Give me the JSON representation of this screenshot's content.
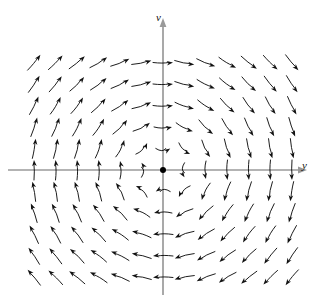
{
  "figure": {
    "kind": "direction-field",
    "background_color": "#ffffff"
  },
  "axes": {
    "horizontal": {
      "label": "y",
      "label_style": "italic",
      "color": "#9a9a9a",
      "has_arrowhead": true,
      "arrowhead_side": "right"
    },
    "vertical": {
      "label": "v",
      "label_style": "italic",
      "color": "#9a9a9a",
      "has_arrowhead": true,
      "arrowhead_side": "top"
    },
    "origin_marker": {
      "shape": "filled-dot",
      "color": "#000000",
      "radius_px": 3
    }
  },
  "chart_data": {
    "type": "scatter",
    "title": "",
    "subtitle": "",
    "xlabel": "y",
    "ylabel": "v",
    "grid": false,
    "legend": null,
    "annotations": [],
    "field": {
      "name": "clockwise-center",
      "formula_u": "v",
      "formula_v": "-y",
      "rotation": "clockwise",
      "equilibrium": {
        "x": 0,
        "y": 0,
        "type": "center"
      }
    },
    "xlim": [
      -6.5,
      6.5
    ],
    "ylim": [
      -5.5,
      5.5
    ],
    "x": [
      -6,
      -5,
      -4,
      -3,
      -2,
      -1,
      0,
      1,
      2,
      3,
      4,
      5,
      6
    ],
    "y": [
      5,
      4,
      3,
      2,
      1,
      0,
      -1,
      -2,
      -3,
      -4,
      -5
    ],
    "arrow_color": "#111111",
    "arrow_count": 143,
    "columns": 13,
    "rows": 11,
    "arrow_curved": true,
    "magnitude_saturates": true
  },
  "geometry": {
    "origin_px": {
      "x": 163,
      "y": 170
    },
    "spacing_px": 21.5,
    "x_axis_y_px": 170,
    "y_axis_x_px": 163,
    "x_axis_start_px": 8,
    "x_axis_end_px": 300,
    "y_axis_top_px": 25,
    "y_axis_bottom_px": 295,
    "arrow_len_px": 20,
    "head_len_px": 6.2,
    "head_width_px": 4.6
  }
}
